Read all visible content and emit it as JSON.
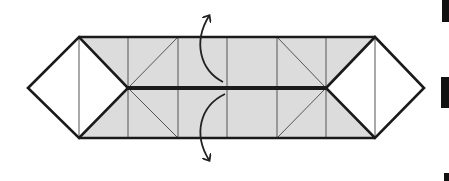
{
  "diagram": {
    "type": "origami-fold-step",
    "colors": {
      "paper_fill": "#dcdcdc",
      "white_fill": "#ffffff",
      "thick_line": "#1a1a1a",
      "thin_line": "#555555",
      "arrow": "#222222",
      "edge_marks": "#111111"
    },
    "shape": {
      "left_tip": [
        28,
        88
      ],
      "right_tip": [
        424,
        88
      ],
      "top_y": 37,
      "bottom_y": 138,
      "center_y": 88,
      "vertical_lines_x": [
        79,
        128,
        178,
        227,
        277,
        326,
        375
      ],
      "inner_left_tip": [
        128,
        88
      ],
      "inner_right_tip": [
        326,
        88
      ]
    },
    "arrows": [
      {
        "name": "fold-top-flap-arrow",
        "direction": "up"
      },
      {
        "name": "fold-bottom-flap-arrow",
        "direction": "down"
      }
    ],
    "edge_marks": [
      {
        "x": 442,
        "y": 0,
        "w": 7,
        "h": 22
      },
      {
        "x": 441,
        "y": 77,
        "w": 8,
        "h": 31
      },
      {
        "x": 444,
        "y": 173,
        "w": 5,
        "h": 8
      }
    ]
  }
}
